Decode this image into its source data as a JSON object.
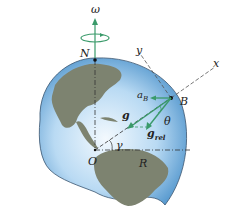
{
  "diagram": {
    "labels": {
      "omega": "ω",
      "north": "N",
      "y_axis": "y",
      "x_axis": "x",
      "a_base": "a",
      "a_sub": "B",
      "point_b": "B",
      "g": "g",
      "theta": "θ",
      "grel_base": "g",
      "grel_sub": "rel",
      "origin": "O",
      "gamma": "γ",
      "radius": "R"
    },
    "colors": {
      "vector": "#3a9a6a",
      "ocean_light": "#cfe6f7",
      "ocean_dark": "#2f7fc0",
      "land": "#7d8370",
      "outline": "#3b5670",
      "dashed": "#444444"
    }
  }
}
